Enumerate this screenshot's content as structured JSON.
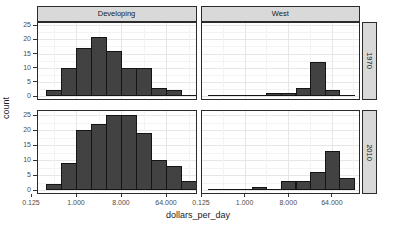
{
  "chart_data": {
    "type": "bar",
    "subtype": "faceted-histogram",
    "title": "",
    "xlabel": "dollars_per_day",
    "ylabel": "count",
    "x_scale": "log2",
    "grid": true,
    "facet_cols": [
      "Developing",
      "West"
    ],
    "facet_rows": [
      "1970",
      "2010"
    ],
    "bins": [
      "0.25-0.5",
      "0.5-1",
      "1-2",
      "2-4",
      "4-8",
      "8-16",
      "16-32",
      "32-64",
      "64-128",
      "128-256"
    ],
    "x_ticks": [
      {
        "label": "0.125",
        "log2": -3
      },
      {
        "label": "1.000",
        "log2": 0
      },
      {
        "label": "8.000",
        "log2": 3
      },
      {
        "label": "64.000",
        "log2": 6
      }
    ],
    "y_ticks": [
      "0",
      "5",
      "10",
      "15",
      "20",
      "25"
    ],
    "ylim": [
      0,
      25
    ],
    "panels": [
      {
        "col": "Developing",
        "row": "1970",
        "counts": [
          2,
          10,
          17,
          21,
          16,
          10,
          10,
          3,
          2,
          0
        ]
      },
      {
        "col": "West",
        "row": "1970",
        "counts": [
          0,
          0,
          0,
          0,
          1,
          1,
          3,
          12,
          2,
          0
        ]
      },
      {
        "col": "Developing",
        "row": "2010",
        "counts": [
          2,
          9,
          20,
          22,
          25,
          25,
          19,
          10,
          8,
          3
        ]
      },
      {
        "col": "West",
        "row": "2010",
        "counts": [
          0,
          0,
          0,
          1,
          0,
          3,
          3,
          6,
          13,
          4
        ]
      }
    ],
    "colors": {
      "bar_fill": "#424242",
      "bar_stroke": "#151515",
      "strip_fill": "#d9d9d9",
      "panel_border": "#2b2b2b",
      "grid_major": "#e6e6e6",
      "grid_minor": "#f3f3f3",
      "axis_text": "#4d4d4d",
      "title_text": "#1a1a1a"
    }
  }
}
